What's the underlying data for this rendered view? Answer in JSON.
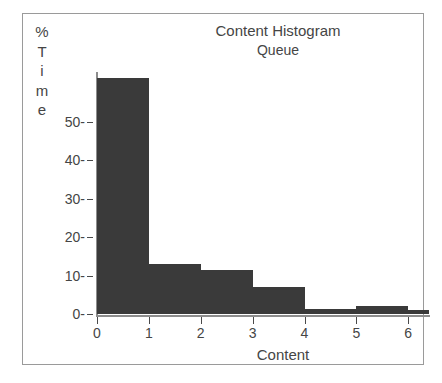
{
  "chart_data": {
    "type": "bar",
    "title": "Content Histogram",
    "subtitle": "Queue",
    "xlabel": "Content",
    "ylabel": "% Time",
    "ylabel_chars": [
      "%",
      "T",
      "i",
      "m",
      "e"
    ],
    "categories": [
      "0",
      "1",
      "2",
      "3",
      "4",
      "5",
      "6"
    ],
    "bins": [
      {
        "start": 0,
        "end": 1,
        "value": 61.5
      },
      {
        "start": 1,
        "end": 2,
        "value": 13.0
      },
      {
        "start": 2,
        "end": 3,
        "value": 11.5
      },
      {
        "start": 3,
        "end": 4,
        "value": 7.0
      },
      {
        "start": 4,
        "end": 5,
        "value": 1.3
      },
      {
        "start": 5,
        "end": 6,
        "value": 2.2
      },
      {
        "start": 6,
        "end": 6.4,
        "value": 1.0
      }
    ],
    "values": [
      61.5,
      13.0,
      11.5,
      7.0,
      1.3,
      2.2,
      1.0
    ],
    "xticks": [
      "0",
      "1",
      "2",
      "3",
      "4",
      "5",
      "6"
    ],
    "yticks": [
      "0-",
      "10-",
      "20-",
      "30-",
      "40-",
      "50-"
    ],
    "ytick_values": [
      0,
      10,
      20,
      30,
      40,
      50
    ],
    "xlim": [
      0,
      6.4
    ],
    "ylim": [
      0,
      63
    ],
    "grid": false,
    "legend": false,
    "bar_color": "#3a3a3a",
    "axis_color": "#8d8d8d",
    "text_color": "#454545",
    "frame_color": "#9a9a9a",
    "background": "#ffffff"
  }
}
